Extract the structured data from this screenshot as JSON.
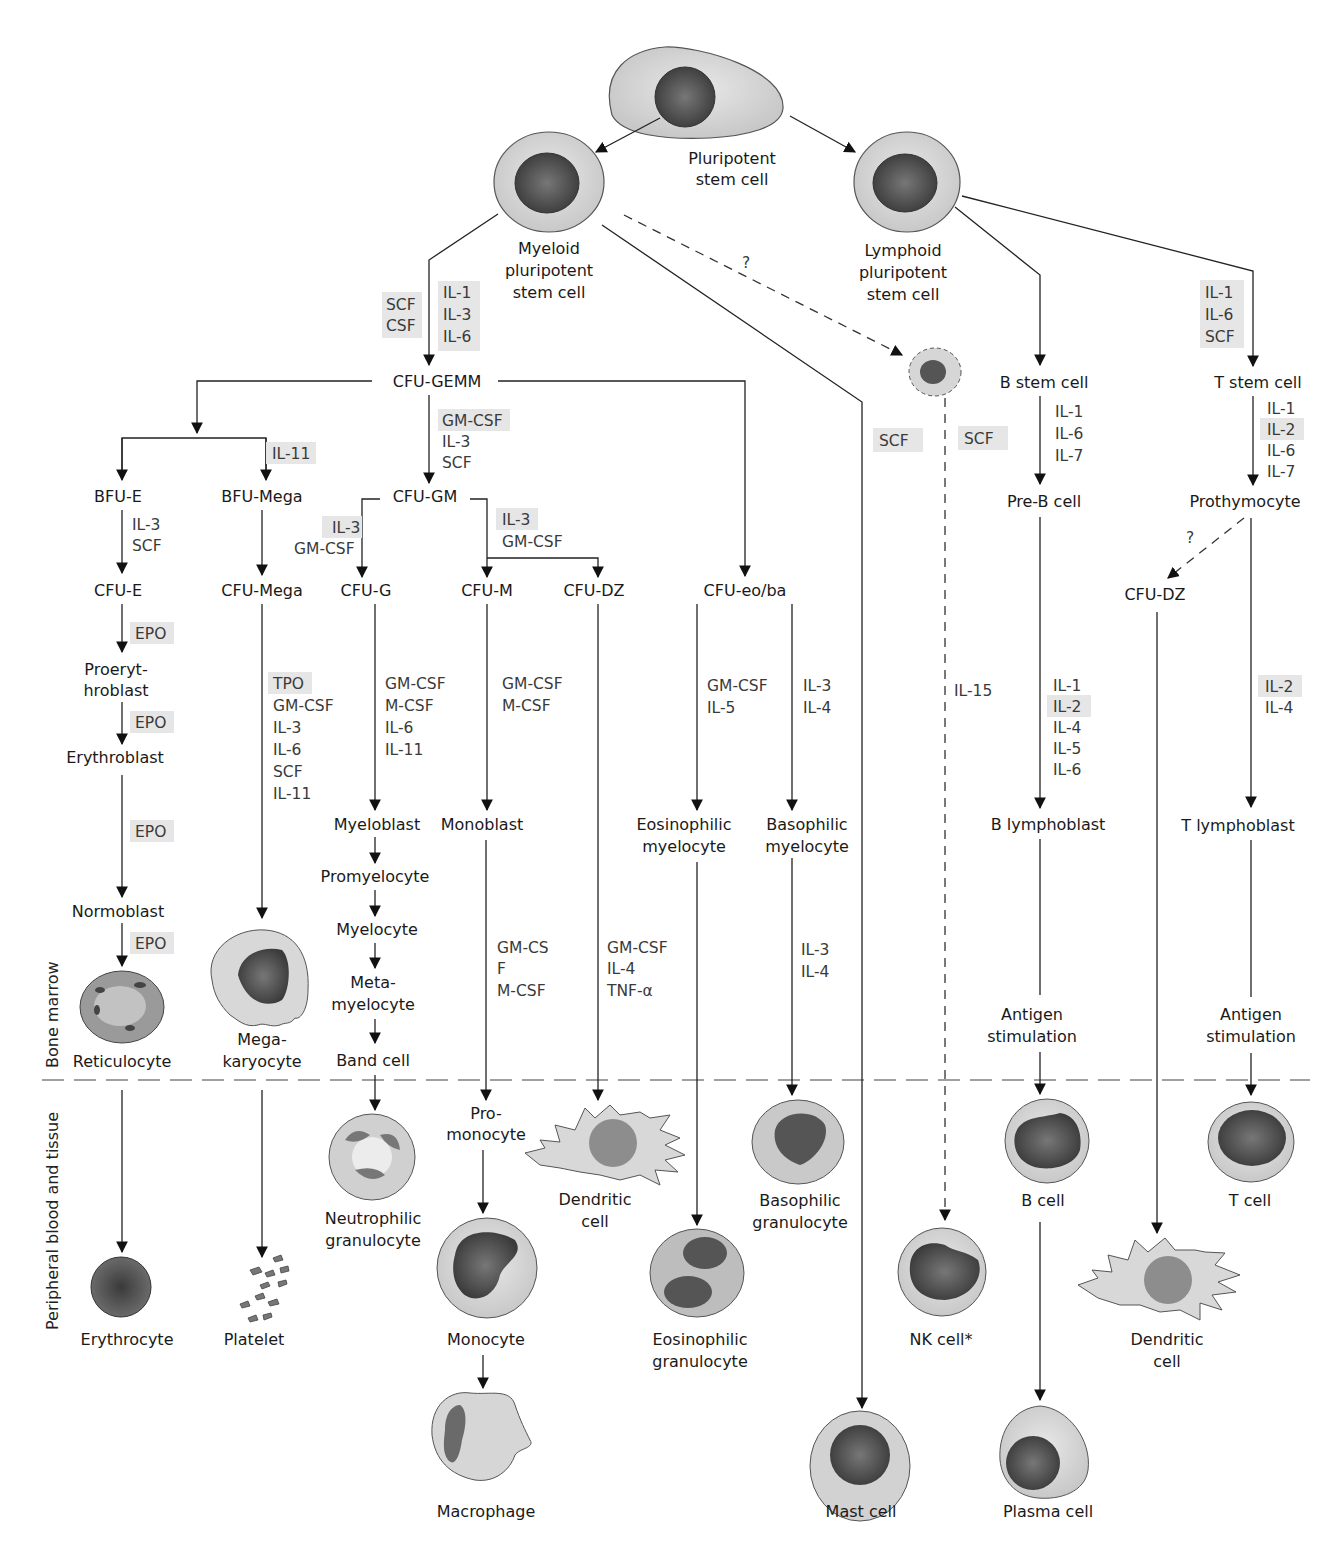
{
  "side_labels": {
    "bone_marrow": "Bone marrow",
    "peripheral": "Peripheral blood and tissue"
  },
  "colors": {
    "highlight_box": "#e6e6e6",
    "line": "#222222",
    "divider": "#a0a0a0",
    "cytoplasm": "#d9d9d9",
    "nucleus": "#5c5c5c"
  },
  "nodes": {
    "pluripotent": [
      "Pluripotent",
      "stem cell"
    ],
    "myeloid": [
      "Myeloid",
      "pluripotent",
      "stem cell"
    ],
    "lymphoid": [
      "Lymphoid",
      "pluripotent",
      "stem cell"
    ],
    "question_mark": "?",
    "cfu_gemm": "CFU-GEMM",
    "bfu_e": "BFU-E",
    "bfu_mega": "BFU-Mega",
    "cfu_gm": "CFU-GM",
    "cfu_e": "CFU-E",
    "cfu_mega": "CFU-Mega",
    "cfu_g": "CFU-G",
    "cfu_m": "CFU-M",
    "cfu_dz": "CFU-DZ",
    "cfu_eo_ba": "CFU-eo/ba",
    "b_stem": "B stem cell",
    "t_stem": "T stem cell",
    "pre_b": "Pre-B cell",
    "prothymocyte": "Prothymocyte",
    "cfu_dz_lymph": "CFU-DZ",
    "proerythroblast": [
      "Proeryt-",
      "hroblast"
    ],
    "erythroblast": "Erythroblast",
    "normoblast": "Normoblast",
    "reticulocyte": "Reticulocyte",
    "megakaryocyte": [
      "Mega-",
      "karyocyte"
    ],
    "myeloblast": "Myeloblast",
    "promyelocyte": "Promyelocyte",
    "myelocyte": "Myelocyte",
    "metamyelocyte": [
      "Meta-",
      "myelocyte"
    ],
    "band_cell": "Band cell",
    "monoblast": "Monoblast",
    "eosinophilic_myelocyte": [
      "Eosinophilic",
      "myelocyte"
    ],
    "basophilic_myelocyte": [
      "Basophilic",
      "myelocyte"
    ],
    "b_lymphoblast": "B lymphoblast",
    "t_lymphoblast": "T lymphoblast",
    "antigen_b": [
      "Antigen",
      "stimulation"
    ],
    "antigen_t": [
      "Antigen",
      "stimulation"
    ],
    "erythrocyte": "Erythrocyte",
    "platelet": "Platelet",
    "neutrophilic_granulocyte": [
      "Neutrophilic",
      "granulocyte"
    ],
    "promonocyte": [
      "Pro-",
      "monocyte"
    ],
    "dendritic_cell_myeloid": [
      "Dendritic",
      "cell"
    ],
    "basophilic_granulocyte": [
      "Basophilic",
      "granulocyte"
    ],
    "monocyte": "Monocyte",
    "eosinophilic_granulocyte": [
      "Eosinophilic",
      "granulocyte"
    ],
    "nk_cell": "NK cell*",
    "b_cell": "B cell",
    "t_cell": "T cell",
    "dendritic_cell_lymphoid": [
      "Dendritic",
      "cell"
    ],
    "macrophage": "Macrophage",
    "mast_cell": "Mast cell",
    "plasma_cell": "Plasma cell"
  },
  "cytokines": {
    "myeloid_to_gemm_left": [
      "SCF",
      "CSF"
    ],
    "myeloid_to_gemm_right": [
      "IL-1",
      "IL-3",
      "IL-6"
    ],
    "gemm_to_gm": [
      {
        "t": "GM-CSF",
        "hl": true
      },
      {
        "t": "IL-3",
        "hl": false
      },
      {
        "t": "SCF",
        "hl": false
      }
    ],
    "bfu_mega": [
      "IL-11"
    ],
    "bfu_e_to_cfu_e": [
      "IL-3",
      "SCF"
    ],
    "gm_to_g": [
      {
        "t": "IL-3",
        "hl": true
      },
      {
        "t": "GM-CSF",
        "hl": false
      }
    ],
    "gm_to_m_dz": [
      {
        "t": "IL-3",
        "hl": true
      },
      {
        "t": "GM-CSF",
        "hl": false
      }
    ],
    "epo_1": "EPO",
    "epo_2": "EPO",
    "epo_3": "EPO",
    "epo_4": "EPO",
    "cfu_mega": [
      {
        "t": "TPO",
        "hl": true
      },
      {
        "t": "GM-CSF",
        "hl": false
      },
      {
        "t": "IL-3",
        "hl": false
      },
      {
        "t": "IL-6",
        "hl": false
      },
      {
        "t": "SCF",
        "hl": false
      },
      {
        "t": "IL-11",
        "hl": false
      }
    ],
    "cfu_g": [
      "GM-CSF",
      "M-CSF",
      "IL-6",
      "IL-11"
    ],
    "cfu_m": [
      "GM-CSF",
      "M-CSF"
    ],
    "cfu_eo": [
      "GM-CSF",
      "IL-5"
    ],
    "cfu_ba": [
      "IL-3",
      "IL-4"
    ],
    "monoblast": [
      "GM-CS",
      "F",
      "M-CSF"
    ],
    "cfu_dz": [
      "GM-CSF",
      "IL-4",
      "TNF-α"
    ],
    "basophil": [
      "IL-3",
      "IL-4"
    ],
    "mast_scf": "SCF",
    "nk_scf": "SCF",
    "nk_il15": "IL-15",
    "t_stem_in": [
      "IL-1",
      "IL-6",
      "SCF"
    ],
    "b_stem_to_preb": [
      "IL-1",
      "IL-6",
      "IL-7"
    ],
    "t_stem_to_prothymo": [
      {
        "t": "IL-1",
        "hl": false
      },
      {
        "t": "IL-2",
        "hl": true
      },
      {
        "t": "IL-6",
        "hl": false
      },
      {
        "t": "IL-7",
        "hl": false
      }
    ],
    "preb_to_blast": [
      {
        "t": "IL-1",
        "hl": false
      },
      {
        "t": "IL-2",
        "hl": true
      },
      {
        "t": "IL-4",
        "hl": false
      },
      {
        "t": "IL-5",
        "hl": false
      },
      {
        "t": "IL-6",
        "hl": false
      }
    ],
    "thymo_to_blast": [
      {
        "t": "IL-2",
        "hl": true
      },
      {
        "t": "IL-4",
        "hl": false
      }
    ],
    "prothymo_question": "?"
  }
}
